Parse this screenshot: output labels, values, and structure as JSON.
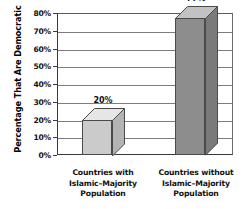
{
  "chart_data": {
    "type": "bar",
    "title": "",
    "xlabel": "",
    "ylabel": "Percentage That Are Democratic",
    "ylim": [
      0,
      80
    ],
    "ytick_step": 10,
    "grid": true,
    "legend": "none",
    "three_d": true,
    "categories": [
      "Countries with Islamic–Majority Population",
      "Countries without Islamic–Majority Population"
    ],
    "values": [
      20,
      77
    ],
    "value_labels": [
      "20%",
      "77%"
    ],
    "ytick_labels": [
      "0%",
      "10%",
      "20%",
      "30%",
      "40%",
      "50%",
      "60%",
      "70%",
      "80%"
    ],
    "ytick_values": [
      0,
      10,
      20,
      30,
      40,
      50,
      60,
      70,
      80
    ],
    "bar_colors": [
      "#cbcbcb",
      "#8d8d8d"
    ],
    "bar_top_colors": [
      "#e6e6e6",
      "#c2c2c2"
    ],
    "bar_side_colors": [
      "#b4b4b4",
      "#7a7a7a"
    ],
    "frame_color": "#3a3a3a",
    "grid_color": "#7d7d7d"
  },
  "axis": {
    "y_title": "Percentage That Are Democratic"
  },
  "categories_lines": [
    [
      "Countries with",
      "Islamic–Majority",
      "Population"
    ],
    [
      "Countries without",
      "Islamic–Majority",
      "Population"
    ]
  ]
}
